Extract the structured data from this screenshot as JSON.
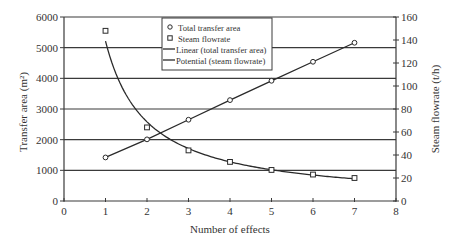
{
  "chart_data": {
    "type": "scatter",
    "title": "",
    "xlabel": "Number of effects",
    "ylabel": "Transfer area (m2)",
    "ylabel_display": "Transfer area (m²)",
    "y2label": "Steam flowrate (t/h)",
    "xlim": [
      0,
      8
    ],
    "ylim": [
      0,
      6000
    ],
    "y2lim": [
      0,
      160
    ],
    "x_ticks": [
      0,
      1,
      2,
      3,
      4,
      5,
      6,
      7,
      8
    ],
    "y_ticks": [
      0,
      1000,
      2000,
      3000,
      4000,
      5000,
      6000
    ],
    "y2_ticks": [
      0,
      20,
      40,
      60,
      80,
      100,
      120,
      140,
      160
    ],
    "grid": {
      "horizontal": true,
      "vertical": false
    },
    "legend_position": "upper center",
    "x": [
      1,
      2,
      3,
      4,
      5,
      6,
      7
    ],
    "series": [
      {
        "name": "Total transfer area",
        "axis": "left",
        "marker": "circle",
        "values": [
          1420,
          2010,
          2650,
          3290,
          3920,
          4540,
          5160
        ]
      },
      {
        "name": "Steam flowrate",
        "axis": "right",
        "marker": "square",
        "values": [
          148,
          64,
          44,
          34,
          27,
          23,
          20
        ]
      },
      {
        "name": "Linear (total transfer area)",
        "axis": "left",
        "line": "trendline-linear",
        "fit_of": "Total transfer area",
        "x_range": [
          1,
          7
        ],
        "values": [
          1420,
          2010,
          2650,
          3290,
          3920,
          4540,
          5160
        ]
      },
      {
        "name": "Potential (steam flowrate)",
        "axis": "right",
        "line": "trendline-power",
        "fit_of": "Steam flowrate",
        "x_range": [
          1,
          7
        ],
        "approx_equation": "y = 136 * x^-1.0",
        "values": [
          136,
          68,
          45.5,
          34,
          27.2,
          22.7,
          19.5
        ]
      }
    ],
    "legend": [
      {
        "label": "Total transfer area",
        "symbol": "circle"
      },
      {
        "label": "Steam flowrate",
        "symbol": "square"
      },
      {
        "label": "Linear (total transfer area)",
        "symbol": "line"
      },
      {
        "label": "Potential (steam flowrate)",
        "symbol": "line"
      }
    ]
  },
  "colors": {
    "axis": "#3a3a3a",
    "grid": "#3a3a3a",
    "series": "#2a2a2a",
    "background": "#ffffff"
  }
}
